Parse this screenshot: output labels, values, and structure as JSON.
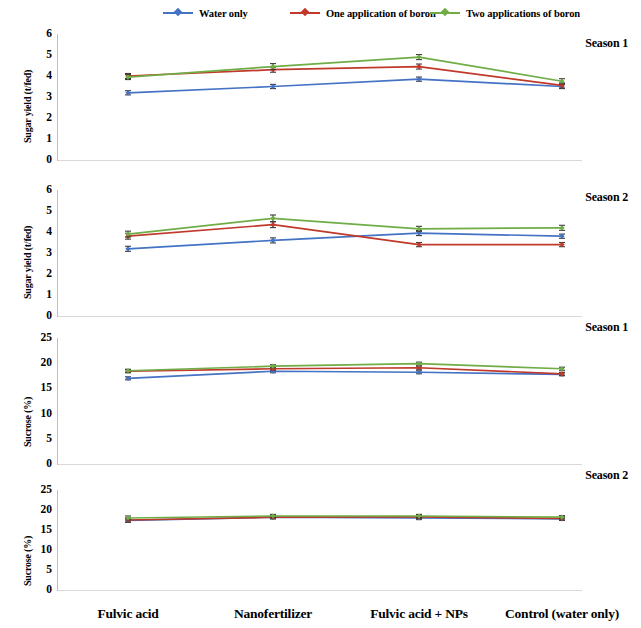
{
  "legend": {
    "items": [
      {
        "label": "Water only",
        "color": "#4472c4",
        "key": "water_only"
      },
      {
        "label": "One application of boron",
        "color": "#c0392b",
        "key": "one_boron"
      },
      {
        "label": "Two applications of boron",
        "color": "#70ad47",
        "key": "two_boron"
      }
    ]
  },
  "categories": [
    "Fulvic acid",
    "Nanofertilizer",
    "Fulvic acid + NPs",
    "Control (water only)"
  ],
  "chart_data": [
    {
      "type": "line",
      "title": "Season 1",
      "ylabel": "Sugar yield (t/fed)",
      "xlabel": "",
      "categories": [
        "Fulvic acid",
        "Nanofertilizer",
        "Fulvic acid + NPs",
        "Control (water only)"
      ],
      "ylim": [
        0,
        6
      ],
      "yticks": [
        0,
        1,
        2,
        3,
        4,
        5,
        6
      ],
      "grid": false,
      "legend_position": "top",
      "series": [
        {
          "name": "Water only",
          "color": "#4472c4",
          "values": [
            3.2,
            3.5,
            3.85,
            3.5
          ],
          "errors": [
            0.1,
            0.1,
            0.1,
            0.1
          ]
        },
        {
          "name": "One application of boron",
          "color": "#c0392b",
          "values": [
            4.0,
            4.3,
            4.45,
            3.55
          ],
          "errors": [
            0.12,
            0.12,
            0.12,
            0.12
          ]
        },
        {
          "name": "Two applications of boron",
          "color": "#70ad47",
          "values": [
            3.95,
            4.45,
            4.9,
            3.75
          ],
          "errors": [
            0.12,
            0.14,
            0.12,
            0.12
          ]
        }
      ]
    },
    {
      "type": "line",
      "title": "Season 2",
      "ylabel": "Sugar yield (t/fed)",
      "xlabel": "",
      "categories": [
        "Fulvic acid",
        "Nanofertilizer",
        "Fulvic acid + NPs",
        "Control (water only)"
      ],
      "ylim": [
        0,
        6
      ],
      "yticks": [
        0,
        1,
        2,
        3,
        4,
        5,
        6
      ],
      "grid": false,
      "legend_position": "top",
      "series": [
        {
          "name": "Water only",
          "color": "#4472c4",
          "values": [
            3.2,
            3.6,
            3.95,
            3.8
          ],
          "errors": [
            0.12,
            0.12,
            0.12,
            0.1
          ]
        },
        {
          "name": "One application of boron",
          "color": "#c0392b",
          "values": [
            3.8,
            4.35,
            3.4,
            3.4
          ],
          "errors": [
            0.14,
            0.14,
            0.1,
            0.1
          ]
        },
        {
          "name": "Two applications of boron",
          "color": "#70ad47",
          "values": [
            3.9,
            4.65,
            4.15,
            4.2
          ],
          "errors": [
            0.14,
            0.16,
            0.12,
            0.12
          ]
        }
      ]
    },
    {
      "type": "line",
      "title": "Season 1",
      "ylabel": "Sucrose (%)",
      "xlabel": "",
      "categories": [
        "Fulvic acid",
        "Nanofertilizer",
        "Fulvic acid + NPs",
        "Control (water only)"
      ],
      "ylim": [
        0,
        25
      ],
      "yticks": [
        0,
        5,
        10,
        15,
        20,
        25
      ],
      "grid": false,
      "legend_position": "top",
      "series": [
        {
          "name": "Water only",
          "color": "#4472c4",
          "values": [
            17.0,
            18.4,
            18.2,
            17.8
          ],
          "errors": [
            0.3,
            0.3,
            0.3,
            0.3
          ]
        },
        {
          "name": "One application of boron",
          "color": "#c0392b",
          "values": [
            18.4,
            18.9,
            19.1,
            17.9
          ],
          "errors": [
            0.3,
            0.3,
            0.3,
            0.3
          ]
        },
        {
          "name": "Two applications of boron",
          "color": "#70ad47",
          "values": [
            18.5,
            19.4,
            19.9,
            18.9
          ],
          "errors": [
            0.3,
            0.3,
            0.3,
            0.3
          ]
        }
      ]
    },
    {
      "type": "line",
      "title": "Season 2",
      "ylabel": "Sucrose (%)",
      "xlabel": "",
      "categories": [
        "Fulvic acid",
        "Nanofertilizer",
        "Fulvic acid + NPs",
        "Control (water only)"
      ],
      "ylim": [
        0,
        25
      ],
      "yticks": [
        0,
        5,
        10,
        15,
        20,
        25
      ],
      "grid": false,
      "legend_position": "top",
      "series": [
        {
          "name": "Water only",
          "color": "#4472c4",
          "values": [
            17.4,
            18.2,
            18.0,
            17.8
          ],
          "errors": [
            0.5,
            0.4,
            0.4,
            0.4
          ]
        },
        {
          "name": "One application of boron",
          "color": "#c0392b",
          "values": [
            17.5,
            18.2,
            18.3,
            17.9
          ],
          "errors": [
            0.5,
            0.4,
            0.4,
            0.4
          ]
        },
        {
          "name": "Two applications of boron",
          "color": "#70ad47",
          "values": [
            18.0,
            18.5,
            18.5,
            18.2
          ],
          "errors": [
            0.5,
            0.4,
            0.4,
            0.4
          ]
        }
      ]
    }
  ]
}
